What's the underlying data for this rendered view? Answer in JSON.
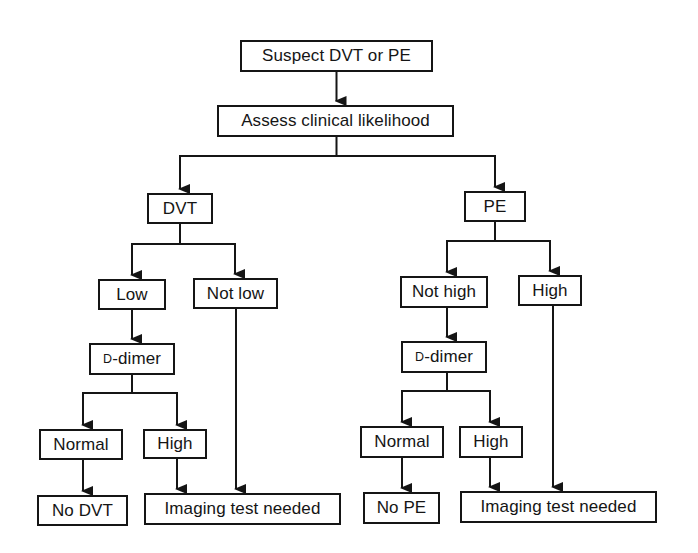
{
  "diagram": {
    "type": "flowchart",
    "title": "",
    "colors": {
      "stroke": "#151515",
      "background": "#ffffff",
      "text": "#151515"
    },
    "nodes": [
      {
        "id": "suspect",
        "label": "Suspect DVT or PE",
        "x": 240,
        "y": 40,
        "w": 193,
        "h": 32
      },
      {
        "id": "assess",
        "label": "Assess clinical likelihood",
        "x": 217,
        "y": 105,
        "w": 237,
        "h": 32
      },
      {
        "id": "dvt",
        "label": "DVT",
        "x": 147,
        "y": 193,
        "w": 66,
        "h": 31
      },
      {
        "id": "pe",
        "label": "PE",
        "x": 464,
        "y": 191,
        "w": 62,
        "h": 31
      },
      {
        "id": "dvt_low",
        "label": "Low",
        "x": 98,
        "y": 279,
        "w": 68,
        "h": 31
      },
      {
        "id": "dvt_notlow",
        "label": "Not low",
        "x": 193,
        "y": 278,
        "w": 85,
        "h": 31
      },
      {
        "id": "dvt_ddimer",
        "label_prefix": "D",
        "label": "-dimer",
        "x": 89,
        "y": 343,
        "w": 86,
        "h": 32
      },
      {
        "id": "pe_nothigh",
        "label": "Not high",
        "x": 400,
        "y": 276,
        "w": 88,
        "h": 32
      },
      {
        "id": "pe_high",
        "label": "High",
        "x": 518,
        "y": 275,
        "w": 64,
        "h": 31
      },
      {
        "id": "pe_ddimer",
        "label_prefix": "D",
        "label": "-dimer",
        "x": 401,
        "y": 341,
        "w": 86,
        "h": 32
      },
      {
        "id": "dvt_normal",
        "label": "Normal",
        "x": 39,
        "y": 429,
        "w": 84,
        "h": 31
      },
      {
        "id": "dvt_dd_high",
        "label": "High",
        "x": 143,
        "y": 429,
        "w": 64,
        "h": 30
      },
      {
        "id": "no_dvt",
        "label": "No DVT",
        "x": 37,
        "y": 495,
        "w": 91,
        "h": 31
      },
      {
        "id": "dvt_imaging",
        "label": "Imaging test needed",
        "x": 144,
        "y": 493,
        "w": 197,
        "h": 32
      },
      {
        "id": "pe_normal",
        "label": "Normal",
        "x": 360,
        "y": 426,
        "w": 84,
        "h": 32
      },
      {
        "id": "pe_dd_high",
        "label": "High",
        "x": 459,
        "y": 426,
        "w": 64,
        "h": 32
      },
      {
        "id": "no_pe",
        "label": "No PE",
        "x": 363,
        "y": 492,
        "w": 77,
        "h": 32
      },
      {
        "id": "pe_imaging",
        "label": "Imaging test needed",
        "x": 460,
        "y": 491,
        "w": 197,
        "h": 32
      }
    ],
    "edges": [
      {
        "from": "suspect",
        "to": "assess"
      },
      {
        "from": "assess",
        "to": "dvt"
      },
      {
        "from": "assess",
        "to": "pe"
      },
      {
        "from": "dvt",
        "to": "dvt_low"
      },
      {
        "from": "dvt",
        "to": "dvt_notlow"
      },
      {
        "from": "dvt_low",
        "to": "dvt_ddimer"
      },
      {
        "from": "dvt_ddimer",
        "to": "dvt_normal"
      },
      {
        "from": "dvt_ddimer",
        "to": "dvt_dd_high"
      },
      {
        "from": "dvt_normal",
        "to": "no_dvt"
      },
      {
        "from": "dvt_dd_high",
        "to": "dvt_imaging"
      },
      {
        "from": "dvt_notlow",
        "to": "dvt_imaging"
      },
      {
        "from": "pe",
        "to": "pe_nothigh"
      },
      {
        "from": "pe",
        "to": "pe_high"
      },
      {
        "from": "pe_nothigh",
        "to": "pe_ddimer"
      },
      {
        "from": "pe_ddimer",
        "to": "pe_normal"
      },
      {
        "from": "pe_ddimer",
        "to": "pe_dd_high"
      },
      {
        "from": "pe_normal",
        "to": "no_pe"
      },
      {
        "from": "pe_dd_high",
        "to": "pe_imaging"
      },
      {
        "from": "pe_high",
        "to": "pe_imaging"
      }
    ],
    "edge_paths": [
      {
        "d": "M336.5 72 L336.5 101"
      },
      {
        "d": "M336.5 137 L336.5 156 L180 156 L180 189"
      },
      {
        "d": "M336.5 156 L495 156 L495 187"
      },
      {
        "d": "M180 224 L180 244 L132 244 L132 275"
      },
      {
        "d": "M180 244 L235 244 L235 274"
      },
      {
        "d": "M132 310 L132 339"
      },
      {
        "d": "M132 375 L132 393 L83 393 L83 425"
      },
      {
        "d": "M132 393 L177 393 L177 425"
      },
      {
        "d": "M83 460 L83 491"
      },
      {
        "d": "M177 459 L177 489"
      },
      {
        "d": "M236 309 L236 489"
      },
      {
        "d": "M495 222 L495 241 L447 241 L447 272"
      },
      {
        "d": "M495 241 L550 241 L550 271"
      },
      {
        "d": "M447 308 L447 337"
      },
      {
        "d": "M447 373 L447 391 L402 391 L402 422"
      },
      {
        "d": "M447 391 L490 391 L490 422"
      },
      {
        "d": "M402 458 L402 488"
      },
      {
        "d": "M490 458 L490 487"
      },
      {
        "d": "M553 306 L553 487"
      }
    ]
  }
}
